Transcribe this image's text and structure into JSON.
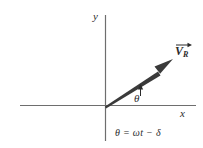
{
  "figure": {
    "background_color": "#ffffff",
    "axis_color": "#6e6e6e",
    "vector_color": "#3a3a3a",
    "text_color": "#2b2b2b",
    "axes": {
      "y_axis_label": "y",
      "x_axis_label": "x",
      "origin": {
        "x": 105,
        "y": 105
      },
      "x_axis_extent": {
        "x1": 20,
        "x2": 196,
        "y": 105
      },
      "y_axis_extent": {
        "y1": 15,
        "y2": 141,
        "x": 105
      }
    },
    "vector": {
      "label": "V",
      "subscript": "R",
      "has_overarrow": true,
      "tail": {
        "x": 105,
        "y": 105
      },
      "tip": {
        "x": 173,
        "y": 60
      }
    },
    "angle": {
      "label": "θ",
      "marker": "rotation-tick"
    },
    "equation": {
      "theta": "θ",
      "equals": "=",
      "omega": "ω",
      "t": "t",
      "minus": "−",
      "delta": "δ",
      "full": "θ = ωt − δ"
    }
  }
}
